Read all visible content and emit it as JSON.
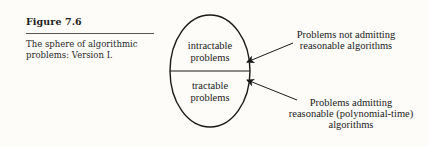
{
  "figure": {
    "label": "Figure 7.6",
    "caption_line1": "The sphere of algorithmic",
    "caption_line2": "problems: Version I."
  },
  "diagram": {
    "upper_region": {
      "line1": "intractable",
      "line2": "problems"
    },
    "lower_region": {
      "line1": "tractable",
      "line2": "problems"
    },
    "annotation_upper": {
      "line1": "Problems not admitting",
      "line2": "reasonable algorithms"
    },
    "annotation_lower": {
      "line1": "Problems admitting",
      "line2": "reasonable (polynomial-time)",
      "line3": "algorithms"
    }
  }
}
